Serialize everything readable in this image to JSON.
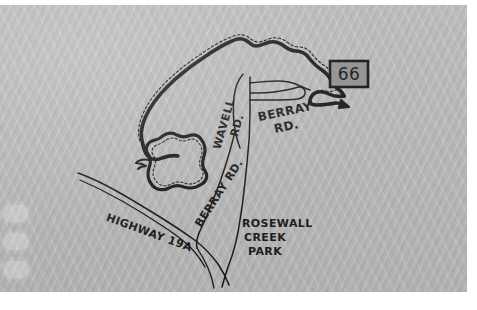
{
  "document": {
    "type": "hand-drawn-map",
    "title": "Rosewall Creek Park area sketch map",
    "paper_color": "#b6b6b6",
    "ink_color": "#181818"
  },
  "map": {
    "labels": [
      {
        "id": "wavell-rd",
        "text": "WAVELL\nRD.",
        "lines": [
          "WAVELL",
          "RD."
        ],
        "x": 228,
        "y": 118,
        "rotation": -74,
        "font_size": 11
      },
      {
        "id": "berray-rd-north",
        "text": "BERRAY\nRD.",
        "lines": [
          "BERRAY",
          "RD."
        ],
        "x": 288,
        "y": 110,
        "rotation": -12,
        "font_size": 12
      },
      {
        "id": "berray-rd-south",
        "text": "BERRAY RD.",
        "lines": [
          "BERRAY RD."
        ],
        "x": 222,
        "y": 190,
        "rotation": -57,
        "font_size": 11
      },
      {
        "id": "highway-19a",
        "text": "HIGHWAY 19A",
        "lines": [
          "HIGHWAY 19A"
        ],
        "x": 148,
        "y": 231,
        "rotation": 20,
        "font_size": 11
      },
      {
        "id": "rosewall-creek-park",
        "text": "ROSEWALL\nCREEK\nPARK",
        "lines": [
          "ROSEWALL",
          "CREEK",
          "PARK"
        ],
        "x": 248,
        "y": 228,
        "rotation": 0,
        "font_size": 11
      }
    ],
    "route_shield": {
      "id": "route-66-shield",
      "number": "66",
      "x": 330,
      "y": 56,
      "width": 38,
      "height": 26,
      "fill": "#8f8f8f",
      "border": "#141414"
    },
    "features": {
      "shoreline": "thick black coastline with dashed beach line running from the lower-left headland up over the northern peninsula and down to the pointed spit at the right edge near the Route 66 shield",
      "lagoon": "closed irregular lake / lagoon outline with dashed inner shore, west-centre of the map",
      "roads": [
        {
          "name": "WAVELL RD.",
          "kind": "secondary"
        },
        {
          "name": "BERRAY RD.",
          "kind": "secondary"
        },
        {
          "name": "HIGHWAY 19A",
          "kind": "highway"
        }
      ],
      "park": "ROSEWALL CREEK PARK, south-centre, bounded by Berray Rd. and Highway 19A"
    }
  },
  "edge_controls": {
    "items": [
      {
        "id": "ghost-control-1",
        "label": ""
      },
      {
        "id": "ghost-control-2",
        "label": ""
      },
      {
        "id": "ghost-control-3",
        "label": ""
      }
    ]
  }
}
